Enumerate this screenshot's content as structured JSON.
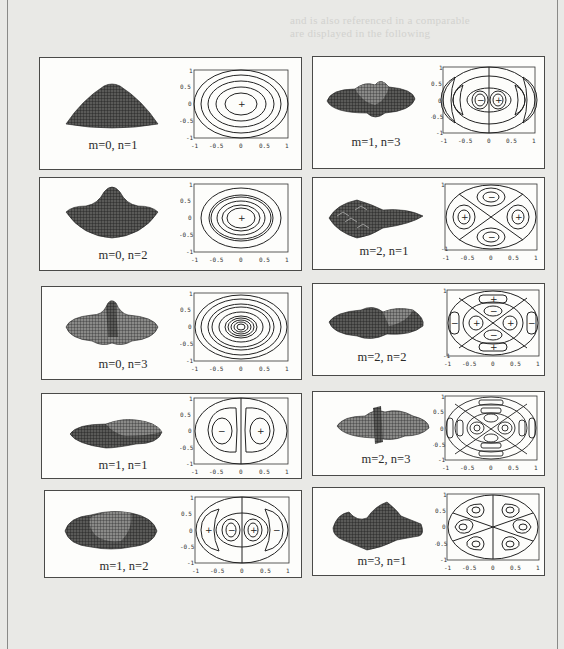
{
  "figure": {
    "ghost_text": [
      "and is also referenced in a comparable",
      "are displayed in the following"
    ],
    "axis_ticks_x": [
      "-1",
      "-0.5",
      "0",
      "0.5",
      "1"
    ],
    "axis_ticks_y": [
      "1",
      "0.5",
      "0",
      "-0.5",
      "-1"
    ],
    "panels": [
      {
        "id": "m0n1",
        "label": "m=0, n=1",
        "column": "left",
        "row": 1
      },
      {
        "id": "m0n2",
        "label": "m=0, n=2",
        "column": "left",
        "row": 2
      },
      {
        "id": "m0n3",
        "label": "m=0, n=3",
        "column": "left",
        "row": 3
      },
      {
        "id": "m1n1",
        "label": "m=1, n=1",
        "column": "left",
        "row": 4
      },
      {
        "id": "m1n2",
        "label": "m=1, n=2",
        "column": "left",
        "row": 5
      },
      {
        "id": "m1n3",
        "label": "m=1, n=3",
        "column": "right",
        "row": 1
      },
      {
        "id": "m2n1",
        "label": "m=2, n=1",
        "column": "right",
        "row": 2
      },
      {
        "id": "m2n2",
        "label": "m=2, n=2",
        "column": "right",
        "row": 3
      },
      {
        "id": "m2n3",
        "label": "m=2, n=3",
        "column": "right",
        "row": 4
      },
      {
        "id": "m3n1",
        "label": "m=3, n=1",
        "column": "right",
        "row": 5
      }
    ],
    "signs": {
      "plus": "+",
      "minus": "−"
    }
  }
}
